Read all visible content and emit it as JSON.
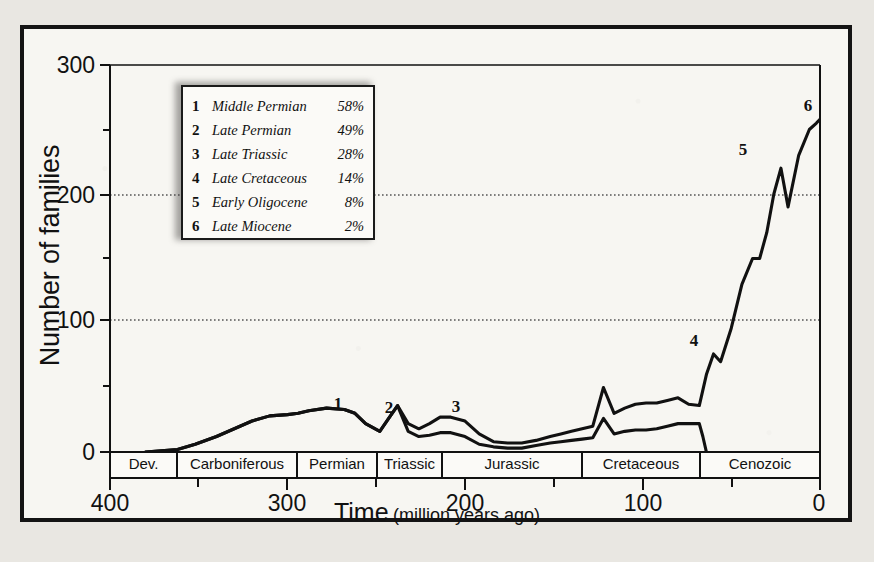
{
  "figure": {
    "y_axis_title": "Number of families",
    "x_axis_title_main": "Time",
    "x_axis_title_sub": "(million years ago)"
  },
  "legend": {
    "rows": [
      {
        "num": "1",
        "name": "Middle Permian",
        "pct": "58%"
      },
      {
        "num": "2",
        "name": "Late Permian",
        "pct": "49%"
      },
      {
        "num": "3",
        "name": "Late Triassic",
        "pct": "28%"
      },
      {
        "num": "4",
        "name": "Late Cretaceous",
        "pct": "14%"
      },
      {
        "num": "5",
        "name": "Early Oligocene",
        "pct": "8%"
      },
      {
        "num": "6",
        "name": "Late Miocene",
        "pct": "2%"
      }
    ]
  },
  "chart_data": {
    "type": "line",
    "title": "",
    "xlabel": "Time (million years ago)",
    "ylabel": "Number of families",
    "xlim": [
      400,
      0
    ],
    "ylim": [
      0,
      300
    ],
    "x_ticks_major": [
      400,
      300,
      200,
      100,
      0
    ],
    "x_ticks_minor": [
      350,
      250,
      150,
      50
    ],
    "y_ticks_major": [
      0,
      100,
      200,
      300
    ],
    "y_ticks_minor": [
      50,
      150,
      250
    ],
    "gridlines": [
      100,
      200
    ],
    "grid": "dotted-horizontal",
    "legend_position": "upper-left-inset",
    "periods": [
      {
        "label": "Dev.",
        "start": 400,
        "end": 362
      },
      {
        "label": "Carboniferous",
        "start": 362,
        "end": 294
      },
      {
        "label": "Permian",
        "start": 294,
        "end": 248
      },
      {
        "label": "Triassic",
        "start": 248,
        "end": 211
      },
      {
        "label": "Jurassic",
        "start": 211,
        "end": 131
      },
      {
        "label": "Cretaceous",
        "start": 131,
        "end": 64
      },
      {
        "label": "Cenozoic",
        "start": 64,
        "end": 0
      }
    ],
    "series": [
      {
        "name": "Number of families (total diversity)",
        "x": [
          380,
          362,
          352,
          340,
          330,
          320,
          310,
          300,
          294,
          288,
          278,
          268,
          262,
          256,
          248,
          243,
          238,
          232,
          226,
          220,
          214,
          208,
          200,
          192,
          184,
          176,
          168,
          160,
          152,
          146,
          140,
          134,
          128,
          122,
          116,
          110,
          104,
          98,
          92,
          86,
          80,
          74,
          68,
          64,
          60,
          56,
          50,
          44,
          38,
          34,
          30,
          26,
          22,
          18,
          12,
          6,
          2,
          0
        ],
        "y": [
          0,
          2,
          6,
          12,
          18,
          24,
          28,
          29,
          30,
          32,
          34,
          33,
          30,
          22,
          16,
          26,
          36,
          22,
          18,
          22,
          27,
          27,
          24,
          14,
          8,
          7,
          7,
          9,
          12,
          14,
          16,
          18,
          20,
          50,
          30,
          34,
          37,
          38,
          38,
          40,
          42,
          37,
          36,
          60,
          76,
          70,
          96,
          130,
          150,
          150,
          170,
          200,
          220,
          190,
          230,
          250,
          255,
          258
        ]
      },
      {
        "name": "Lower curve (families excluding short-lived taxa)",
        "x": [
          380,
          362,
          352,
          340,
          330,
          320,
          310,
          300,
          294,
          288,
          278,
          268,
          262,
          256,
          248,
          243,
          238,
          232,
          226,
          220,
          214,
          208,
          200,
          192,
          184,
          176,
          168,
          160,
          152,
          146,
          140,
          134,
          128,
          122,
          116,
          110,
          104,
          98,
          92,
          86,
          80,
          74,
          68,
          66,
          64
        ],
        "y": [
          0,
          2,
          6,
          12,
          18,
          24,
          28,
          29,
          30,
          32,
          34,
          33,
          30,
          22,
          16,
          26,
          36,
          16,
          12,
          13,
          15,
          15,
          12,
          6,
          4,
          3,
          3,
          5,
          7,
          8,
          9,
          10,
          11,
          26,
          14,
          16,
          17,
          17,
          18,
          20,
          22,
          22,
          22,
          12,
          0
        ]
      }
    ],
    "event_markers": [
      {
        "num": "1",
        "event": "Middle Permian",
        "extinction_pct": 58,
        "x_myr": 256,
        "y_families": 22
      },
      {
        "num": "2",
        "event": "Late Permian",
        "extinction_pct": 49,
        "x_myr": 238,
        "y_families": 36
      },
      {
        "num": "3",
        "event": "Late Triassic",
        "extinction_pct": 28,
        "x_myr": 212,
        "y_families": 27
      },
      {
        "num": "4",
        "event": "Late Cretaceous",
        "extinction_pct": 14,
        "x_myr": 66,
        "y_families": 76
      },
      {
        "num": "5",
        "event": "Early Oligocene",
        "extinction_pct": 8,
        "x_myr": 32,
        "y_families": 220
      },
      {
        "num": "6",
        "event": "Late Miocene",
        "extinction_pct": 2,
        "x_myr": 8,
        "y_families": 258
      }
    ]
  },
  "colors": {
    "frame": "#141414",
    "paper": "#f7f6f2",
    "page_background": "#e9e7e2",
    "curve": "#111111",
    "gridline": "#555555"
  }
}
